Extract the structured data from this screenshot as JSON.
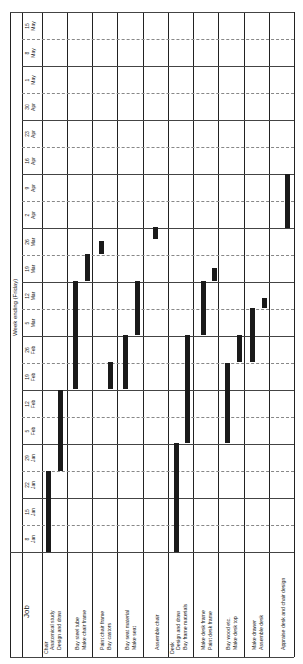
{
  "chart_data": {
    "type": "gantt",
    "orientation": "rotated-90-ccw",
    "title": "Week ending (Friday)",
    "row_header": "Job",
    "weeks": [
      "8 Jan",
      "15 Jan",
      "22 Jan",
      "29 Jan",
      "5 Feb",
      "12 Feb",
      "19 Feb",
      "26 Feb",
      "5 Mar",
      "12 Mar",
      "19 Mar",
      "26 Mar",
      "2 Apr",
      "9 Apr",
      "16 Apr",
      "23 Apr",
      "30 Apr",
      "1 May",
      "8 May",
      "15 May"
    ],
    "week_labels": [
      {
        "day": "8",
        "month": "Jan"
      },
      {
        "day": "15",
        "month": "Jan"
      },
      {
        "day": "22",
        "month": "Jan"
      },
      {
        "day": "29",
        "month": "Jan"
      },
      {
        "day": "5",
        "month": "Feb"
      },
      {
        "day": "12",
        "month": "Feb"
      },
      {
        "day": "19",
        "month": "Feb"
      },
      {
        "day": "26",
        "month": "Feb"
      },
      {
        "day": "5",
        "month": "Mar"
      },
      {
        "day": "12",
        "month": "Mar"
      },
      {
        "day": "19",
        "month": "Mar"
      },
      {
        "day": "26",
        "month": "Mar"
      },
      {
        "day": "2",
        "month": "Apr"
      },
      {
        "day": "9",
        "month": "Apr"
      },
      {
        "day": "16",
        "month": "Apr"
      },
      {
        "day": "23",
        "month": "Apr"
      },
      {
        "day": "30",
        "month": "Apr"
      },
      {
        "day": "1",
        "month": "May"
      },
      {
        "day": "8",
        "month": "May"
      },
      {
        "day": "15",
        "month": "May"
      }
    ],
    "groups": [
      {
        "section": "Chair",
        "jobs": [
          "Anatomical study",
          "Design and draw"
        ]
      },
      {
        "jobs": [
          "Buy steel tube",
          "Make chair frame"
        ]
      },
      {
        "jobs": [
          "Paint chair frame",
          "Buy castors"
        ]
      },
      {
        "jobs": [
          "Buy seat material",
          "Make seat"
        ]
      },
      {
        "jobs": [
          "Assemble chair"
        ]
      },
      {
        "section": "Desk",
        "jobs": [
          "Design and draw",
          "Buy frame materials"
        ]
      },
      {
        "jobs": [
          "Make desk frame",
          "Paint desk frame"
        ]
      },
      {
        "jobs": [
          "Buy wood etc.",
          "Make desk top"
        ]
      },
      {
        "jobs": [
          "Make drawer",
          "Assemble desk"
        ]
      },
      {
        "jobs": [
          "Appraise desk and chair design"
        ]
      }
    ],
    "tasks": [
      {
        "job": "Anatomical study",
        "start_week": 0,
        "end_week": 2.9
      },
      {
        "job": "Design and draw (chair)",
        "start_week": 3,
        "end_week": 5.9
      },
      {
        "job": "Buy steel tube",
        "start_week": 6,
        "end_week": 9.9
      },
      {
        "job": "Make chair frame",
        "start_week": 10,
        "end_week": 10.9
      },
      {
        "job": "Paint chair frame",
        "start_week": 11,
        "end_week": 11.5
      },
      {
        "job": "Buy castors",
        "start_week": 6,
        "end_week": 6.9
      },
      {
        "job": "Buy seat material",
        "start_week": 6,
        "end_week": 7.9
      },
      {
        "job": "Make seat",
        "start_week": 8,
        "end_week": 9.9
      },
      {
        "job": "Assemble chair",
        "start_week": 11,
        "end_week": 11.5
      },
      {
        "job": "Design and draw (desk)",
        "start_week": 0,
        "end_week": 3.9
      },
      {
        "job": "Buy frame materials",
        "start_week": 4,
        "end_week": 7.9
      },
      {
        "job": "Make desk frame",
        "start_week": 8,
        "end_week": 9.9
      },
      {
        "job": "Paint desk frame",
        "start_week": 10,
        "end_week": 10.5
      },
      {
        "job": "Buy wood etc.",
        "start_week": 4,
        "end_week": 6.9
      },
      {
        "job": "Make desk top",
        "start_week": 7,
        "end_week": 7.9
      },
      {
        "job": "Make drawer",
        "start_week": 7,
        "end_week": 8.9
      },
      {
        "job": "Assemble desk",
        "start_week": 9,
        "end_week": 9.5
      },
      {
        "job": "Appraise desk and chair design",
        "start_week": 12,
        "end_week": 13.9
      }
    ]
  },
  "labels": {
    "title": "Week ending (Friday)",
    "job_header": "Job",
    "groups": [
      {
        "l1": "Chair",
        "l2": "Anatomical study",
        "l3": "Design and draw"
      },
      {
        "l1": "",
        "l2": "Buy steel tube",
        "l3": "Make chair frame"
      },
      {
        "l1": "",
        "l2": "Paint chair frame",
        "l3": "Buy castors"
      },
      {
        "l1": "",
        "l2": "Buy seat material",
        "l3": "Make seat"
      },
      {
        "l1": "",
        "l2": "Assemble chair",
        "l3": ""
      },
      {
        "l1": "Desk",
        "l2": "Design and draw",
        "l3": "Buy frame materials"
      },
      {
        "l1": "",
        "l2": "Make desk frame",
        "l3": "Paint desk frame"
      },
      {
        "l1": "",
        "l2": "Buy wood etc.",
        "l3": "Make desk top"
      },
      {
        "l1": "",
        "l2": "Make drawer",
        "l3": "Assemble desk"
      },
      {
        "l1": "",
        "l2": "Appraise desk and chair design",
        "l3": ""
      }
    ]
  },
  "colors": {
    "bar": "#1a1a1a",
    "grid": "#444444",
    "background": "#ffffff"
  }
}
